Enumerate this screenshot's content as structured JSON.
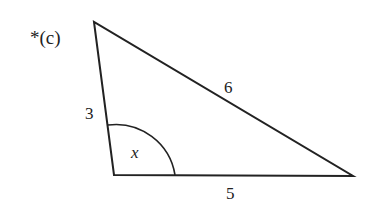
{
  "problem_label": "*(c)",
  "triangle": {
    "side_left": "3",
    "side_top": "6",
    "side_bottom": "5",
    "angle_label": "x"
  },
  "colors": {
    "stroke": "#222222",
    "background": "#ffffff"
  }
}
